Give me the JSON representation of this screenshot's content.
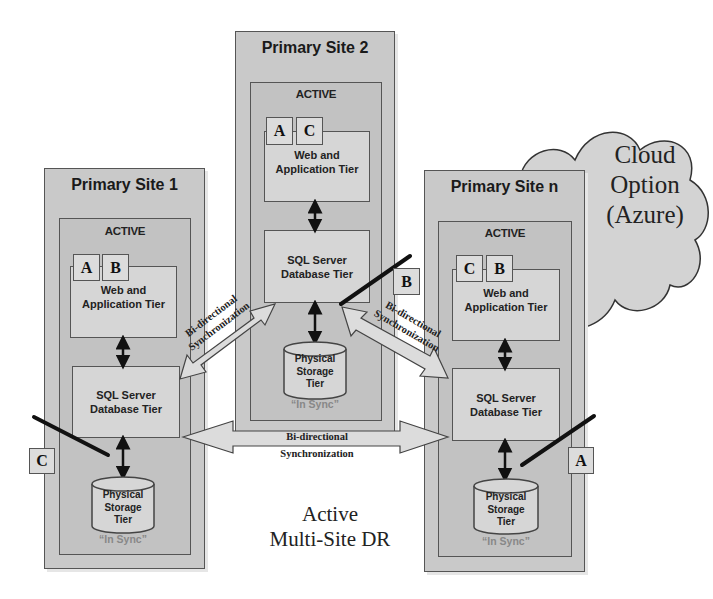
{
  "diagram": {
    "title_line1": "Active",
    "title_line2": "Multi-Site DR",
    "cloud": {
      "line1": "Cloud",
      "line2": "Option",
      "line3": "(Azure)"
    },
    "sites": [
      {
        "name": "Primary Site 1",
        "state": "ACTIVE",
        "web_tier": "Web and Application Tier",
        "web_tier_line1": "Web and",
        "web_tier_line2": "Application Tier",
        "db_tier_line1": "SQL Server",
        "db_tier_line2": "Database Tier",
        "storage_line1": "Physical",
        "storage_line2": "Storage",
        "storage_line3": "Tier",
        "storage_status": "“In Sync”",
        "app_badges": [
          "A",
          "B"
        ],
        "external_badge": "C"
      },
      {
        "name": "Primary Site 2",
        "state": "ACTIVE",
        "web_tier_line1": "Web and",
        "web_tier_line2": "Application Tier",
        "db_tier_line1": "SQL Server",
        "db_tier_line2": "Database Tier",
        "storage_line1": "Physical",
        "storage_line2": "Storage",
        "storage_line3": "Tier",
        "storage_status": "“In Sync”",
        "app_badges": [
          "A",
          "C"
        ],
        "external_badge": "B"
      },
      {
        "name": "Primary Site n",
        "state": "ACTIVE",
        "web_tier_line1": "Web and",
        "web_tier_line2": "Application Tier",
        "db_tier_line1": "SQL Server",
        "db_tier_line2": "Database Tier",
        "storage_line1": "Physical",
        "storage_line2": "Storage",
        "storage_line3": "Tier",
        "storage_status": "“In Sync”",
        "app_badges": [
          "C",
          "B"
        ],
        "external_badge": "A"
      }
    ],
    "sync_links": [
      {
        "from": "Primary Site 1",
        "to": "Primary Site 2",
        "line1": "Bi-directional",
        "line2": "Synchronization"
      },
      {
        "from": "Primary Site 2",
        "to": "Primary Site n",
        "line1": "Bi-directional",
        "line2": "Synchronization"
      },
      {
        "from": "Primary Site 1",
        "to": "Primary Site n",
        "line1": "Bi-directional",
        "line2": "Synchronization"
      }
    ],
    "colors": {
      "site_fill": "#c9c9c9",
      "tier_fill": "#d6d6d6",
      "border": "#555555",
      "status_text": "#888888",
      "cloud_fill": "#d0d0d0"
    }
  }
}
